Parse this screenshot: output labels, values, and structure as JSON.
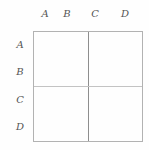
{
  "figure": {
    "column_labels": [
      "A",
      "B",
      "C",
      "D"
    ],
    "row_labels": [
      "A",
      "B",
      "C",
      "D"
    ],
    "colors": {
      "background": "#fefefe",
      "border": "#b2b2b2",
      "vertical_divider": "#8e8e8e",
      "horizontal_divider": "#c3c3c3",
      "label_text": "#555555"
    }
  }
}
